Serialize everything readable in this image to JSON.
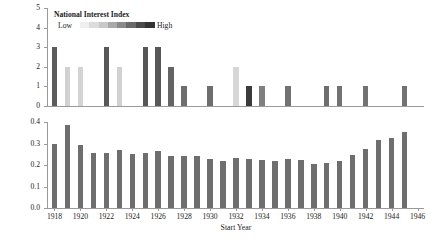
{
  "chart_data": {
    "type": "bar",
    "title": "",
    "panels": [
      {
        "name": "interventions",
        "ylabel": "Number of Interventions",
        "ylim": [
          0,
          5
        ],
        "yticks": [
          "0",
          "1",
          "2",
          "3",
          "4",
          "5"
        ],
        "ytick_values": [
          0,
          1,
          2,
          3,
          4,
          5
        ],
        "grid": false,
        "value_key": "interventions",
        "color_key": "national_interest_index",
        "comment": "bar shade encodes National Interest Index (light = Low, dark = High)"
      },
      {
        "name": "cinc",
        "ylabel": "CINC Index [US Power]",
        "ylim": [
          0.0,
          0.4
        ],
        "yticks": [
          "0.0",
          "0.1",
          "0.2",
          "0.3",
          "0.4"
        ],
        "ytick_values": [
          0.0,
          0.1,
          0.2,
          0.3,
          0.4
        ],
        "grid": false,
        "value_key": "cinc",
        "bar_color": "#6e6e6e"
      }
    ],
    "xlabel": "Start Year",
    "xlim": [
      1917.5,
      1946.5
    ],
    "xticks": [
      "1918",
      "1920",
      "1922",
      "1924",
      "1926",
      "1928",
      "1930",
      "1932",
      "1934",
      "1936",
      "1938",
      "1940",
      "1942",
      "1944",
      "1946"
    ],
    "xtick_values": [
      1918,
      1920,
      1922,
      1924,
      1926,
      1928,
      1930,
      1932,
      1934,
      1936,
      1938,
      1940,
      1942,
      1944,
      1946
    ],
    "years": [
      1918,
      1919,
      1920,
      1921,
      1922,
      1923,
      1924,
      1925,
      1926,
      1927,
      1928,
      1929,
      1930,
      1931,
      1932,
      1933,
      1934,
      1935,
      1936,
      1937,
      1938,
      1939,
      1940,
      1941,
      1942,
      1943,
      1944,
      1945
    ],
    "interventions": [
      3,
      2,
      2,
      0,
      3,
      2,
      0,
      3,
      3,
      2,
      1,
      0,
      1,
      0,
      2,
      1,
      1,
      0,
      1,
      0,
      0,
      1,
      1,
      0,
      1,
      0,
      0,
      1
    ],
    "national_interest_index": [
      0.78,
      0.22,
      0.2,
      null,
      0.8,
      0.22,
      null,
      0.8,
      0.8,
      0.74,
      0.7,
      null,
      0.7,
      null,
      0.18,
      0.95,
      0.62,
      null,
      0.68,
      null,
      null,
      0.7,
      0.68,
      null,
      0.68,
      null,
      null,
      0.68
    ],
    "cinc": [
      0.297,
      0.386,
      0.291,
      0.254,
      0.255,
      0.272,
      0.253,
      0.254,
      0.263,
      0.242,
      0.243,
      0.242,
      0.23,
      0.221,
      0.234,
      0.229,
      0.222,
      0.219,
      0.226,
      0.224,
      0.205,
      0.211,
      0.219,
      0.247,
      0.273,
      0.315,
      0.327,
      0.355
    ],
    "legend": {
      "title": "National Interest Index",
      "low_label": "Low",
      "high_label": "High",
      "position": "upper-left inside top panel",
      "gradient_stops": [
        "#eeeeee",
        "#dcdcdc",
        "#c8c8c8",
        "#a9a9a9",
        "#8a8a8a",
        "#6a6a6a",
        "#4a4a4a",
        "#333333"
      ]
    },
    "colors": {
      "axis": "#9a9a9a",
      "text": "#1a1a1a",
      "bar_dark": "#6e6e6e",
      "bar_light": "#d9d9d9",
      "bar_mid": "#9b9b9b",
      "bar_darkest": "#4a4a4a"
    }
  }
}
